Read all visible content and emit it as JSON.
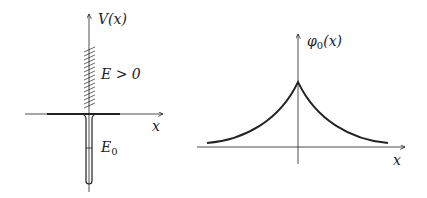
{
  "left_panel": {
    "y_axis_label": "V(x)",
    "x_axis_label": "x",
    "continuum_label": "E > 0",
    "bound_state_label_main": "E",
    "bound_state_label_sub": "0"
  },
  "right_panel": {
    "y_axis_label_main": "φ",
    "y_axis_label_sub": "0",
    "y_axis_label_arg": "(x)",
    "x_axis_label": "x"
  },
  "colors": {
    "line": "#222222",
    "background": "#ffffff"
  }
}
